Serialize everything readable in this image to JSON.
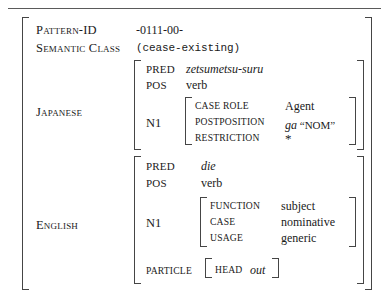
{
  "figure": {
    "kind": "attribute-value-matrix",
    "top_rule": true
  },
  "outer": {
    "rows": [
      {
        "attr": "Pattern-ID",
        "value": "-0111-00-"
      },
      {
        "attr": "Semantic Class",
        "value": "(cease-existing)"
      }
    ],
    "japanese_label": "Japanese",
    "english_label": "English"
  },
  "japanese": {
    "pred_attr": "PRED",
    "pred_value": "zetsumetsu-suru",
    "pos_attr": "POS",
    "pos_value": "verb",
    "n1_attr": "N1",
    "n1": [
      {
        "attr": "CASE ROLE",
        "value": "Agent"
      },
      {
        "attr": "POSTPOSITION",
        "value_italic": "ga",
        "value_quoted": "NOM"
      },
      {
        "attr": "RESTRICTION",
        "value": "*"
      }
    ]
  },
  "english": {
    "pred_attr": "PRED",
    "pred_value": "die",
    "pos_attr": "POS",
    "pos_value": "verb",
    "n1_attr": "N1",
    "n1": [
      {
        "attr": "FUNCTION",
        "value": "subject"
      },
      {
        "attr": "CASE",
        "value": "nominative"
      },
      {
        "attr": "USAGE",
        "value": "generic"
      }
    ],
    "particle_attr": "PARTICLE",
    "particle": [
      {
        "attr": "HEAD",
        "value": "out"
      }
    ]
  }
}
